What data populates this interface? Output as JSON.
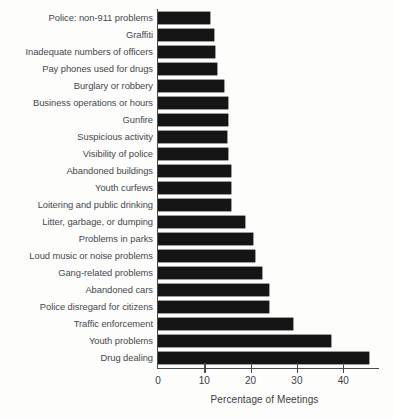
{
  "chart_data": {
    "type": "bar",
    "orientation": "horizontal",
    "title": "",
    "subtitle": "",
    "xlabel": "Percentage of Meetings",
    "ylabel": "",
    "xlim": [
      0,
      47
    ],
    "xticks": [
      0,
      10,
      20,
      30,
      40
    ],
    "xtick_labels": [
      "0",
      "10",
      "20",
      "30",
      "40"
    ],
    "grid": false,
    "legend": null,
    "bar_color": "#151515",
    "axis_color": "#4a4a4a",
    "categories": [
      "Police: non-911 problems",
      "Graffiti",
      "Inadequate numbers of officers",
      "Pay phones used for drugs",
      "Burglary or robbery",
      "Business operations or hours",
      "Gunfire",
      "Suspicious activity",
      "Visibility of police",
      "Abandoned buildings",
      "Youth curfews",
      "Loitering and public drinking",
      "Litter, garbage, or dumping",
      "Problems in parks",
      "Loud music or noise problems",
      "Gang-related problems",
      "Abandoned cars",
      "Police disregard for citizens",
      "Traffic enforcement",
      "Youth problems",
      "Drug dealing"
    ],
    "values": [
      11.3,
      12.0,
      12.2,
      12.7,
      14.2,
      15.0,
      15.0,
      14.8,
      15.1,
      15.8,
      15.8,
      15.8,
      18.7,
      20.5,
      21.0,
      22.4,
      24.0,
      24.0,
      29.2,
      37.3,
      45.5
    ]
  }
}
